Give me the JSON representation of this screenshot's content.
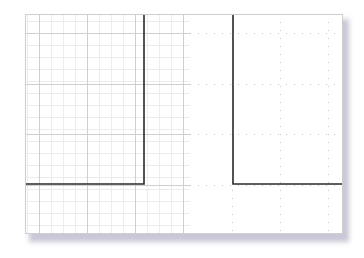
{
  "figure": {
    "type": "graph-paper-drawing",
    "sheet": {
      "x": 25,
      "y": 14,
      "width": 318,
      "height": 220,
      "background": "#ffffff",
      "border_color": "#cfcfcf",
      "shadow_color": "#c9c6d6"
    },
    "grid": {
      "solid_region": {
        "x_start": 25,
        "x_end": 190
      },
      "dotted_region": {
        "x_start": 190,
        "x_end": 343
      },
      "major_color": "#cfcfcf",
      "minor_color": "#ececec",
      "dot_color": "#c8c8c8",
      "major_vertical_x": [
        39,
        87,
        135,
        183
      ],
      "dotted_vertical_x": [
        232,
        280,
        328
      ],
      "major_horizontal_y": [
        33,
        84,
        134,
        185
      ],
      "minor_step": 12
    },
    "shapes": [
      {
        "name": "left-l-shape",
        "color": "#2a2a2a",
        "points": [
          [
            144,
            14
          ],
          [
            144,
            184
          ],
          [
            25,
            184
          ]
        ]
      },
      {
        "name": "right-l-shape",
        "color": "#2a2a2a",
        "points": [
          [
            233,
            14
          ],
          [
            233,
            184
          ],
          [
            343,
            184
          ]
        ]
      }
    ]
  }
}
